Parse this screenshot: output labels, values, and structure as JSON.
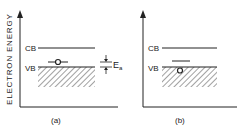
{
  "figure": {
    "y_axis_label": "ELECTRON ENERGY",
    "panels": [
      {
        "id": "a",
        "caption": "(a)",
        "cb_label": "CB",
        "vb_label": "VB",
        "energy_label": "E",
        "energy_subscript": "a"
      },
      {
        "id": "b",
        "caption": "(b)",
        "cb_label": "CB",
        "vb_label": "VB"
      }
    ],
    "colors": {
      "ink": "#222222",
      "background": "#ffffff"
    }
  }
}
